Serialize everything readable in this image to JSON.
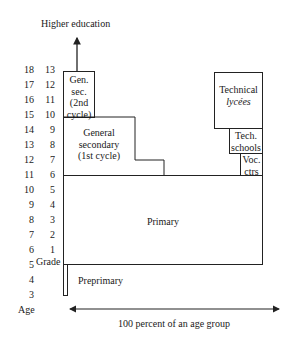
{
  "diagram": {
    "top_label": "Higher education",
    "age_axis_label": "Age",
    "grade_axis_label": "Grade",
    "ages": [
      "18",
      "17",
      "16",
      "15",
      "14",
      "13",
      "12",
      "11",
      "10",
      "9",
      "8",
      "7",
      "6",
      "5",
      "4",
      "3"
    ],
    "grades": [
      "13",
      "12",
      "11",
      "10",
      "9",
      "8",
      "7",
      "6",
      "5",
      "4",
      "3",
      "2",
      "1"
    ],
    "boxes": {
      "gen_sec_2nd": [
        "Gen.",
        "sec.",
        "(2nd",
        "cycle)"
      ],
      "general_secondary_1st": [
        "General",
        "secondary",
        "(1st cycle)"
      ],
      "primary": "Primary",
      "preprimary": "Preprimary",
      "technical_lycees": [
        "Technical",
        "lycées"
      ],
      "tech_schools": [
        "Tech.",
        "schools"
      ],
      "voc_ctrs": [
        "Voc.",
        "ctrs"
      ]
    },
    "bottom_axis_label": "100 percent of an age group",
    "line_color": "#222222"
  }
}
